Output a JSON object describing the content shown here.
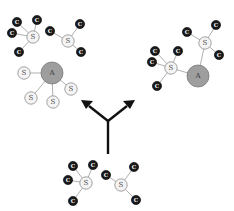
{
  "diagram": {
    "title": "",
    "node_types": {
      "C": {
        "label": "C",
        "color": "#1a1a1a"
      },
      "S": {
        "label": "S",
        "color": "#f4f4f4"
      },
      "A": {
        "label": "A",
        "color": "#9e9e9e"
      }
    },
    "groups": [
      {
        "name": "top-left-molecules",
        "molecules": [
          {
            "center": "S",
            "neighbors": [
              "C",
              "C",
              "C",
              "C"
            ]
          },
          {
            "center": "S",
            "neighbors": [
              "C",
              "C",
              "C"
            ]
          }
        ]
      },
      {
        "name": "left-aggregate",
        "center": "A",
        "neighbors": [
          "S",
          "S",
          "S",
          "S"
        ]
      },
      {
        "name": "right-aggregate",
        "center": "A",
        "attached_molecules": [
          {
            "center": "S",
            "neighbors": [
              "C",
              "C",
              "C",
              "C"
            ]
          },
          {
            "center": "S",
            "neighbors": [
              "C",
              "C",
              "C"
            ]
          }
        ]
      },
      {
        "name": "bottom-molecules",
        "molecules": [
          {
            "center": "S",
            "neighbors": [
              "C",
              "C",
              "C",
              "C"
            ]
          },
          {
            "center": "S",
            "neighbors": [
              "C",
              "C",
              "C"
            ]
          }
        ]
      }
    ],
    "arrows": {
      "description": "branching arrow from bottom molecules splitting into two outcomes",
      "targets": [
        "left-aggregate",
        "right-aggregate"
      ]
    }
  }
}
